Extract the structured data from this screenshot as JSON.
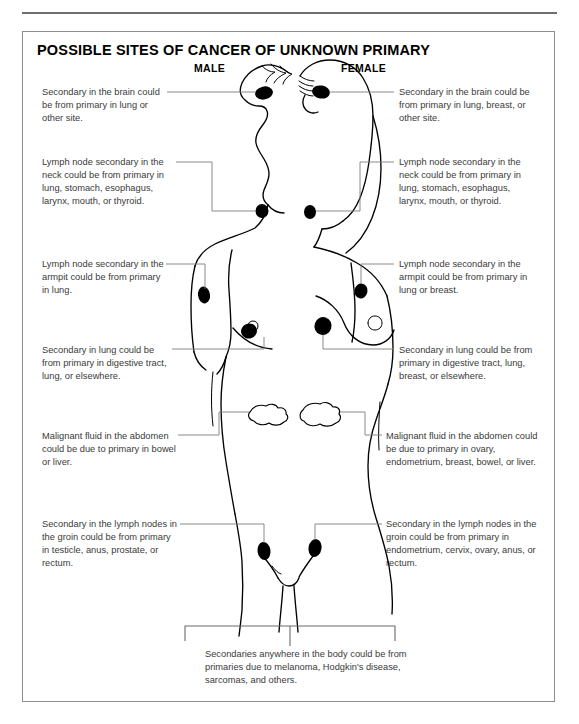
{
  "figure": {
    "title": "POSSIBLE SITES OF CANCER OF UNKNOWN PRIMARY",
    "sex_labels": {
      "male": "MALE",
      "female": "FEMALE"
    },
    "caption": "Secondaries anywhere in the body could be from primaries due to melanoma, Hodgkin's disease, sarcomas, and others."
  },
  "callouts": {
    "left": [
      {
        "id": "brain",
        "text": "Secondary in the brain could be from primary in lung or other site."
      },
      {
        "id": "neck",
        "text": "Lymph node secondary in the neck could be from primary in lung, stomach, esophagus, larynx, mouth, or thyroid."
      },
      {
        "id": "armpit",
        "text": "Lymph node secondary in the armpit could be from primary in lung."
      },
      {
        "id": "lung",
        "text": "Secondary in lung could be from primary in digestive tract, lung, or elsewhere."
      },
      {
        "id": "abdomen",
        "text": "Malignant fluid in the abdomen could be due to primary in bowel or liver."
      },
      {
        "id": "groin",
        "text": "Secondary in the lymph nodes in the groin could be from primary in testicle, anus, prostate, or rectum."
      }
    ],
    "right": [
      {
        "id": "brain",
        "text": "Secondary in the brain could be from primary in lung, breast, or other site."
      },
      {
        "id": "neck",
        "text": "Lymph node secondary in the neck could be from primary in lung, stomach, esophagus, larynx, mouth, or thyroid."
      },
      {
        "id": "armpit",
        "text": "Lymph node secondary in the armpit could be from primary in lung or breast."
      },
      {
        "id": "lung",
        "text": "Secondary in lung could be from primary in digestive tract, lung, breast, or elsewhere."
      },
      {
        "id": "abdomen",
        "text": "Malignant fluid in the abdomen could be due to primary in ovary, endometrium, breast, bowel, or liver."
      },
      {
        "id": "groin",
        "text": "Secondary in the lymph nodes in the groin could be from primary in endometrium, cervix, ovary, anus, or rectum."
      }
    ]
  },
  "markers": {
    "description": "Filled black nodes marking metastatic sites",
    "sites": [
      "brain-male",
      "brain-female",
      "neck-male",
      "neck-female",
      "armpit-male",
      "armpit-female",
      "breast-male",
      "breast-female",
      "groin-male",
      "groin-female"
    ],
    "fluid_sites": [
      "abdomen-male",
      "abdomen-female"
    ]
  },
  "colors": {
    "ink": "#000000",
    "text": "#3a3a3a",
    "leader": "#7d7d7d",
    "frame": "#8d8d8d",
    "rule": "#6f6f6f",
    "background": "#ffffff"
  }
}
